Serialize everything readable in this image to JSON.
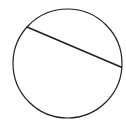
{
  "figure": {
    "background_color": "#ffffff",
    "stroke_color": "#1f1f1f",
    "circle_stroke_width": 1.2,
    "chord_stroke_width": 1.5,
    "circle": {
      "cx": 67.5,
      "cy": 63.5,
      "r": 54.5
    },
    "chord": {
      "x1": 27,
      "y1": 27,
      "x2": 121.5,
      "y2": 67.3
    }
  }
}
